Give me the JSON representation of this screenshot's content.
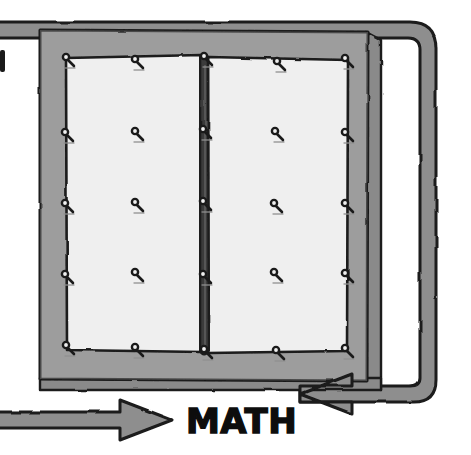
{
  "scene": {
    "title": "MATH",
    "kind": "hand-drawn bulletin board illustration",
    "caption_label": "MATH",
    "background_color": "#ffffff"
  },
  "colors": {
    "background": "#ffffff",
    "ink": "#1a1a1a",
    "frame_gray": "#9a9a9a",
    "frame_gray_dark": "#7e7e7e",
    "frame_gray_light": "#b0b0b0",
    "paper_white": "#efefef",
    "paper_shadow": "#e2e2e2",
    "arrow_gray": "#8e8e8e",
    "spine_dark": "#2a2a2a"
  },
  "board": {
    "name": "bulletin-board",
    "frame": {
      "x": 38,
      "y": 28,
      "width": 332,
      "height": 352,
      "fill": "#9a9a9a"
    },
    "side_edge": {
      "x": 370,
      "y": 36,
      "width": 12,
      "height": 352,
      "fill": "#8a8a8a"
    },
    "bottom_edge": {
      "x": 40,
      "y": 380,
      "width": 340,
      "height": 10,
      "fill": "#8a8a8a"
    },
    "left_sheet": {
      "x": 66,
      "y": 58,
      "width": 137,
      "height": 292,
      "fill": "#efefef"
    },
    "right_sheet": {
      "x": 210,
      "y": 58,
      "width": 137,
      "height": 292,
      "fill": "#efefef"
    },
    "spine": {
      "x": 200,
      "y": 54,
      "width": 9,
      "height": 300,
      "fill": "#2a2a2a"
    }
  },
  "pins": [
    {
      "id": "pin-r1-c1",
      "x": 66,
      "y": 57
    },
    {
      "id": "pin-r1-c2",
      "x": 135,
      "y": 59
    },
    {
      "id": "pin-r1-c3",
      "x": 204,
      "y": 56
    },
    {
      "id": "pin-r1-c4",
      "x": 277,
      "y": 61
    },
    {
      "id": "pin-r1-c5",
      "x": 345,
      "y": 58
    },
    {
      "id": "pin-r2-c1",
      "x": 65,
      "y": 132
    },
    {
      "id": "pin-r2-c2",
      "x": 135,
      "y": 131
    },
    {
      "id": "pin-r2-c3",
      "x": 203,
      "y": 129
    },
    {
      "id": "pin-r2-c4",
      "x": 275,
      "y": 131
    },
    {
      "id": "pin-r2-c5",
      "x": 345,
      "y": 132
    },
    {
      "id": "pin-r3-c1",
      "x": 65,
      "y": 203
    },
    {
      "id": "pin-r3-c2",
      "x": 135,
      "y": 202
    },
    {
      "id": "pin-r3-c3",
      "x": 203,
      "y": 201
    },
    {
      "id": "pin-r3-c4",
      "x": 274,
      "y": 203
    },
    {
      "id": "pin-r3-c5",
      "x": 345,
      "y": 203
    },
    {
      "id": "pin-r4-c1",
      "x": 65,
      "y": 274
    },
    {
      "id": "pin-r4-c2",
      "x": 135,
      "y": 272
    },
    {
      "id": "pin-r4-c3",
      "x": 203,
      "y": 274
    },
    {
      "id": "pin-r4-c4",
      "x": 274,
      "y": 272
    },
    {
      "id": "pin-r4-c5",
      "x": 345,
      "y": 273
    },
    {
      "id": "pin-r5-c1",
      "x": 66,
      "y": 345
    },
    {
      "id": "pin-r5-c2",
      "x": 135,
      "y": 347
    },
    {
      "id": "pin-r5-c3",
      "x": 204,
      "y": 349
    },
    {
      "id": "pin-r5-c4",
      "x": 276,
      "y": 350
    },
    {
      "id": "pin-r5-c5",
      "x": 345,
      "y": 348
    }
  ],
  "arrows": {
    "left": {
      "name": "left-arrow",
      "direction": "right",
      "points_to": "MATH",
      "shaft": {
        "x": -10,
        "y": 412,
        "width": 130,
        "height": 16
      },
      "head_tip_x": 172
    },
    "right": {
      "name": "right-arrow-curved",
      "direction": "left",
      "points_to": "MATH",
      "path_description": "curves from top-right corner down the right side then left to the MATH label",
      "head_tip_x": 300
    }
  },
  "edge_marks": [
    {
      "id": "left-edge-fragment",
      "x": 0,
      "y": 50,
      "width": 5,
      "height": 22
    }
  ]
}
